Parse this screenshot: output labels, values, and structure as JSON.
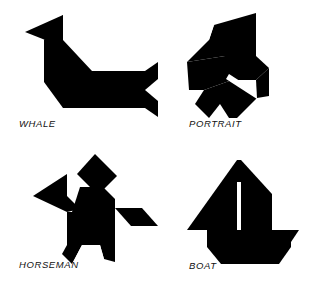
{
  "page": {
    "background_color": "#ffffff",
    "shape_color": "#000000",
    "width": 317,
    "height": 284
  },
  "figures": [
    {
      "id": "whale",
      "label": "WHALE",
      "position": "top-left",
      "description": "Tangram silhouette of a whale with upright tail fin at left and notched fluke at right",
      "pieces": 7
    },
    {
      "id": "portrait",
      "label": "PORTRAIT",
      "position": "top-right",
      "description": "Tangram silhouette of a human head in profile facing left with a thin white gap at the jaw",
      "pieces": 7
    },
    {
      "id": "horseman",
      "label": "HORSEMAN",
      "position": "bottom-left",
      "description": "Tangram silhouette of a horse with a detached diamond rider head above the body",
      "pieces": 7
    },
    {
      "id": "boat",
      "label": "BOAT",
      "position": "bottom-right",
      "description": "Tangram silhouette of a sailboat with two triangular sails split by a thin white mast line and a hull below",
      "pieces": 7
    }
  ]
}
